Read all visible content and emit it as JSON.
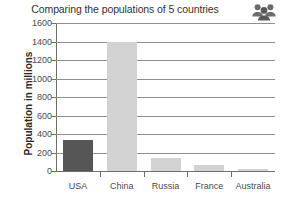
{
  "chart_data": {
    "type": "bar",
    "title": "Comparing the populations of 5 countries",
    "xlabel": "",
    "ylabel": "Population in millions",
    "categories": [
      "USA",
      "China",
      "Russia",
      "France",
      "Australia"
    ],
    "values": [
      330,
      1395,
      145,
      65,
      25
    ],
    "ylim": [
      0,
      1600
    ],
    "ytick_step": 200,
    "yticks": [
      "0",
      "200",
      "400",
      "600",
      "800",
      "1000",
      "1200",
      "1400",
      "1600"
    ],
    "grid": "horizontal",
    "legend": "none",
    "bar_colors": [
      "#565656",
      "#d2d2d2",
      "#d2d2d2",
      "#d2d2d2",
      "#d2d2d2"
    ]
  },
  "icons": {
    "group": "people-group-icon"
  },
  "colors": {
    "axis": "#6e6e6e",
    "grid": "#8f8f8f",
    "text": "#3a3a3a",
    "bar_dark": "#565656",
    "bar_light": "#d2d2d2",
    "icon": "#6b6b6b",
    "background": "#ffffff"
  }
}
